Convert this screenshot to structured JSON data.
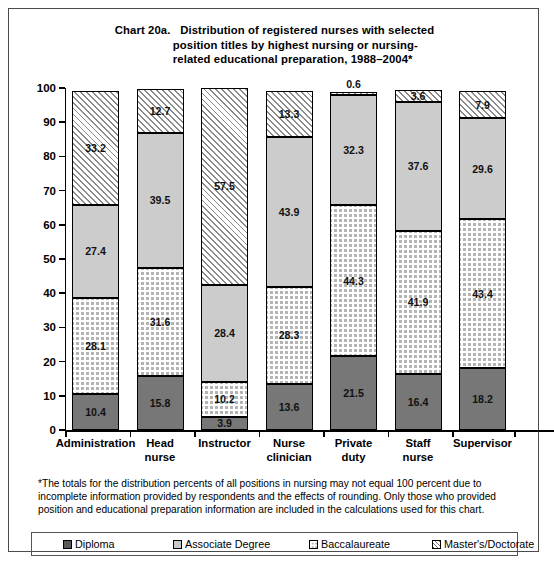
{
  "title": {
    "label": "Chart 20a.",
    "line1": "Distribution of registered nurses with selected",
    "line2": "position titles by highest nursing or nursing-",
    "line3": "related educational preparation, 1988–2004*"
  },
  "footnote": "*The totals for the distribution percents of all positions in nursing may not equal 100 percent due to incomplete information provided by respondents and the effects of rounding. Only those who provided position and educational preparation information are included in the calculations used for this chart.",
  "legend": [
    {
      "label": "Diploma",
      "swatch": "diploma-swatch",
      "color": "#5a5a5a"
    },
    {
      "label": "Associate Degree",
      "swatch": "associate-swatch",
      "color": "#c9c9c9"
    },
    {
      "label": "Baccalaureate",
      "swatch": "baccalaureate-swatch",
      "color": "#b0b0b0"
    },
    {
      "label": "Master's/Doctorate",
      "swatch": "masters-swatch",
      "color": "#ffffff"
    }
  ],
  "chart_data": {
    "type": "bar",
    "subtype": "stacked-vertical-100",
    "xlabel": "",
    "ylabel": "",
    "ylim": [
      0,
      100
    ],
    "yticks": [
      0,
      10,
      20,
      30,
      40,
      50,
      60,
      70,
      80,
      90,
      100
    ],
    "grid": false,
    "legend_position": "bottom",
    "categories": [
      "Administration",
      "Head nurse",
      "Instructor",
      "Nurse clinician",
      "Private duty",
      "Staff nurse",
      "Supervisor"
    ],
    "category_lines": [
      [
        "Administration"
      ],
      [
        "Head",
        "nurse"
      ],
      [
        "Instructor"
      ],
      [
        "Nurse",
        "clinician"
      ],
      [
        "Private",
        "duty"
      ],
      [
        "Staff",
        "nurse"
      ],
      [
        "Supervisor"
      ]
    ],
    "series": [
      {
        "name": "Diploma",
        "values": [
          10.4,
          15.8,
          3.9,
          13.6,
          21.5,
          16.4,
          18.2
        ]
      },
      {
        "name": "Baccalaureate",
        "values": [
          28.1,
          31.6,
          10.2,
          28.3,
          44.3,
          41.9,
          43.4
        ]
      },
      {
        "name": "Associate Degree",
        "values": [
          27.4,
          39.5,
          28.4,
          43.9,
          32.3,
          37.6,
          29.6
        ]
      },
      {
        "name": "Master's/Doctorate",
        "values": [
          33.2,
          12.7,
          57.5,
          13.3,
          0.6,
          3.6,
          7.9
        ]
      }
    ],
    "stack_order_bottom_to_top": [
      "Diploma",
      "Baccalaureate",
      "Associate Degree",
      "Master's/Doctorate"
    ]
  }
}
